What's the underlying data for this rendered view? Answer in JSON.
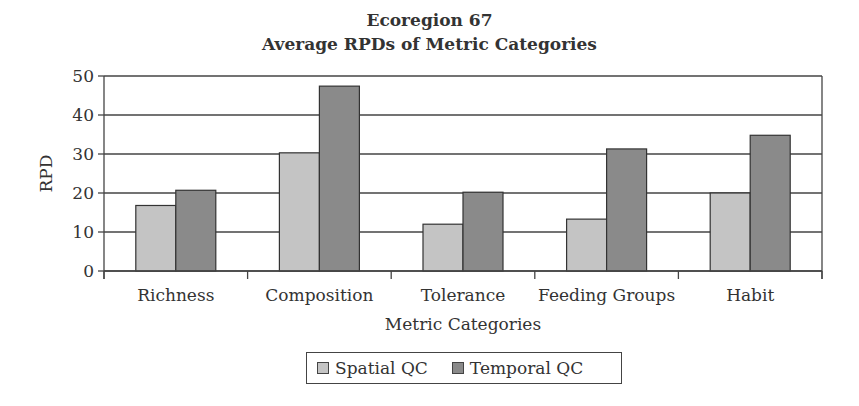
{
  "chart_data": {
    "type": "bar",
    "title": "Ecoregion 67",
    "subtitle": "Average RPDs of Metric Categories",
    "xlabel": "Metric Categories",
    "ylabel": "RPD",
    "ylim": [
      0,
      50
    ],
    "yticks": [
      0,
      10,
      20,
      30,
      40,
      50
    ],
    "grid": true,
    "legend_position": "bottom",
    "categories": [
      "Richness",
      "Composition",
      "Tolerance",
      "Feeding Groups",
      "Habit"
    ],
    "series": [
      {
        "name": "Spatial QC",
        "color": "#c4c4c4",
        "values": [
          16.8,
          30.3,
          12.0,
          13.3,
          20.0
        ]
      },
      {
        "name": "Temporal QC",
        "color": "#8a8a8a",
        "values": [
          20.7,
          47.4,
          20.2,
          31.3,
          34.8
        ]
      }
    ]
  }
}
